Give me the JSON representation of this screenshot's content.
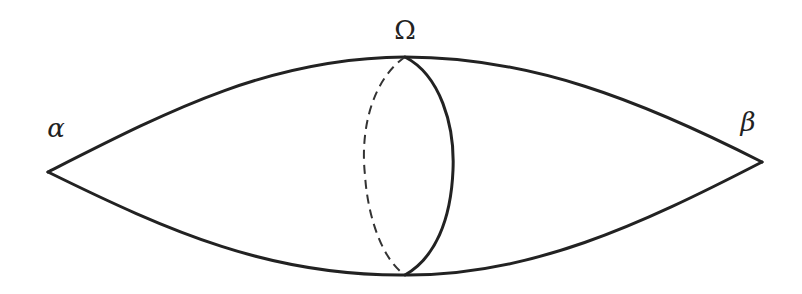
{
  "diagram": {
    "type": "spindle-with-cross-section",
    "stroke_color": "#222222",
    "background": "#ffffff",
    "labels": {
      "left_vertex": "α",
      "top_section": "Ω",
      "right_vertex": "β"
    },
    "points": {
      "left_vertex": [
        48,
        172
      ],
      "right_vertex": [
        762,
        162
      ],
      "section_top": [
        405,
        57
      ],
      "section_bottom": [
        405,
        275
      ]
    },
    "cross_section": {
      "front_half": "solid",
      "back_half": "dashed"
    }
  }
}
